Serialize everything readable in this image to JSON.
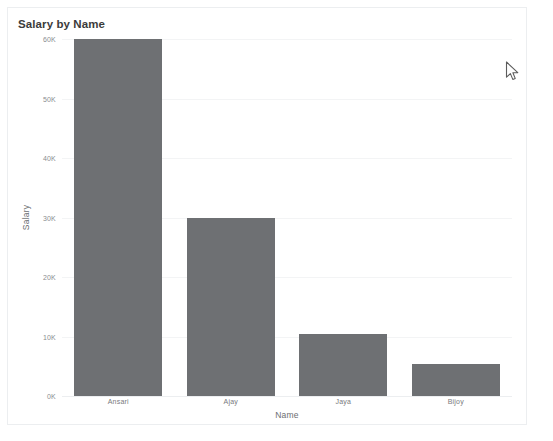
{
  "chart_data": {
    "type": "bar",
    "title": "Salary by Name",
    "xlabel": "Name",
    "ylabel": "Salary",
    "categories": [
      "Ansari",
      "Ajay",
      "Jaya",
      "Bijoy"
    ],
    "values": [
      60000,
      30000,
      10500,
      5400
    ],
    "ylim": [
      0,
      60000
    ],
    "yticks": [
      0,
      10000,
      20000,
      30000,
      40000,
      50000,
      60000
    ],
    "ytick_labels": [
      "0K",
      "10K",
      "20K",
      "30K",
      "40K",
      "50K",
      "60K"
    ],
    "grid": true,
    "legend": false,
    "bar_color": "#6e7073",
    "background_color": "#ffffff",
    "border_color": "#eceef0"
  },
  "cursor": {
    "icon": "mouse-pointer-icon",
    "x": 511,
    "y": 68
  }
}
